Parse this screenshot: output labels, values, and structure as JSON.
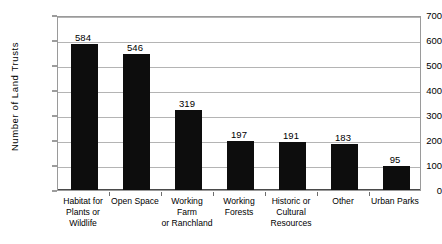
{
  "chart_data": {
    "type": "bar",
    "title": "",
    "xlabel": "",
    "ylabel": "Number of Land Trusts",
    "ylim": [
      0,
      700
    ],
    "ytick_step": 100,
    "yticks": [
      0,
      100,
      200,
      300,
      400,
      500,
      600,
      700
    ],
    "grid": true,
    "legend": false,
    "bar_color": "#0d0d0d",
    "gridline_color": "#b4b4b4",
    "categories": [
      "Habitat for Plants or Wildlife",
      "Open Space",
      "Working Farm or Ranchland",
      "Working Forests",
      "Historic or Cultural Resources",
      "Other",
      "Urban Parks"
    ],
    "category_lines": [
      [
        "Habitat for",
        "Plants or",
        "Wildlife"
      ],
      [
        "Open Space"
      ],
      [
        "Working Farm",
        "or Ranchland"
      ],
      [
        "Working",
        "Forests"
      ],
      [
        "Historic or",
        "Cultural",
        "Resources"
      ],
      [
        "Other"
      ],
      [
        "Urban Parks"
      ]
    ],
    "values": [
      584,
      546,
      319,
      197,
      191,
      183,
      95
    ],
    "value_labels": [
      "584",
      "546",
      "319",
      "197",
      "191",
      "183",
      "95"
    ]
  }
}
